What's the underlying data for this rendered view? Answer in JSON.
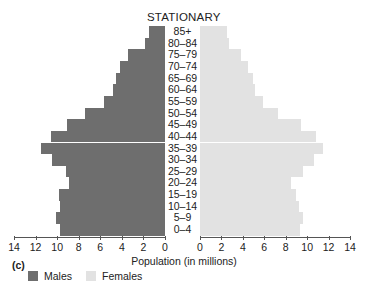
{
  "chart_data": {
    "type": "bar",
    "orientation": "horizontal",
    "subtype": "population-pyramid",
    "panel_label": "(c)",
    "xlabel": "Population (in millions)",
    "ylabel": "",
    "categories": [
      "85+",
      "80–84",
      "75–79",
      "70–74",
      "65–69",
      "60–64",
      "55–59",
      "50–54",
      "45–49",
      "40–44",
      "35–39",
      "30–34",
      "25–29",
      "20–24",
      "15–19",
      "10–14",
      "5–9",
      "0–4"
    ],
    "series": [
      {
        "name": "Males",
        "color": "#6e6e6e",
        "side": "left",
        "values": [
          1.5,
          1.9,
          3.4,
          4.2,
          4.5,
          4.8,
          5.7,
          7.4,
          9.1,
          10.6,
          11.5,
          10.5,
          9.2,
          8.9,
          9.8,
          9.7,
          10.1,
          9.7
        ]
      },
      {
        "name": "Females",
        "color": "#e2e2e2",
        "side": "right",
        "values": [
          2.5,
          2.7,
          3.8,
          4.5,
          4.9,
          5.1,
          5.9,
          7.3,
          9.4,
          10.8,
          11.5,
          10.6,
          9.6,
          8.5,
          9.0,
          9.2,
          9.6,
          9.3
        ]
      }
    ],
    "xlim": [
      0,
      14
    ],
    "x_ticks_left": [
      "14",
      "12",
      "10",
      "8",
      "6",
      "4",
      "2",
      "0"
    ],
    "x_ticks_right": [
      "0",
      "2",
      "4",
      "6",
      "8",
      "10",
      "12",
      "14"
    ],
    "grid": false,
    "legend": {
      "position": "bottom-left",
      "entries": [
        "Males",
        "Females"
      ]
    }
  }
}
